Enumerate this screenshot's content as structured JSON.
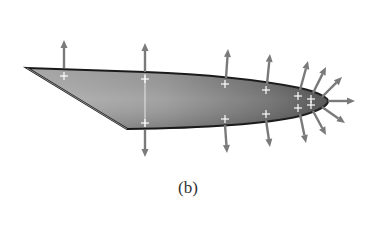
{
  "figure": {
    "caption": "(b)",
    "colors": {
      "fill_light": "#a8a8a8",
      "fill_dark": "#5a5a5a",
      "outline": "#1a1a1a",
      "arrow": "#7a7a7a",
      "charge_sign": "#ffffff"
    },
    "charge_symbol": "+",
    "charges": [
      {
        "x": 64,
        "y": 76
      },
      {
        "x": 145,
        "y": 79
      },
      {
        "x": 145,
        "y": 123
      },
      {
        "x": 225,
        "y": 84
      },
      {
        "x": 225,
        "y": 119
      },
      {
        "x": 266,
        "y": 90
      },
      {
        "x": 266,
        "y": 114
      },
      {
        "x": 298,
        "y": 96
      },
      {
        "x": 298,
        "y": 108
      },
      {
        "x": 311,
        "y": 99
      },
      {
        "x": 311,
        "y": 105
      }
    ],
    "field_arrows": [
      {
        "x1": 64,
        "y1": 68,
        "x2": 64,
        "y2": 40
      },
      {
        "x1": 145,
        "y1": 72,
        "x2": 145,
        "y2": 43
      },
      {
        "x1": 145,
        "y1": 130,
        "x2": 145,
        "y2": 157
      },
      {
        "x1": 226,
        "y1": 78,
        "x2": 228,
        "y2": 49
      },
      {
        "x1": 225,
        "y1": 125,
        "x2": 227,
        "y2": 153
      },
      {
        "x1": 267,
        "y1": 84,
        "x2": 270,
        "y2": 54
      },
      {
        "x1": 266,
        "y1": 120,
        "x2": 270,
        "y2": 147
      },
      {
        "x1": 300,
        "y1": 90,
        "x2": 308,
        "y2": 61
      },
      {
        "x1": 300,
        "y1": 114,
        "x2": 306,
        "y2": 143
      },
      {
        "x1": 313,
        "y1": 93,
        "x2": 326,
        "y2": 67
      },
      {
        "x1": 313,
        "y1": 111,
        "x2": 326,
        "y2": 135
      },
      {
        "x1": 322,
        "y1": 97,
        "x2": 342,
        "y2": 77
      },
      {
        "x1": 322,
        "y1": 107,
        "x2": 345,
        "y2": 123
      },
      {
        "x1": 328,
        "y1": 101,
        "x2": 355,
        "y2": 101
      }
    ]
  }
}
